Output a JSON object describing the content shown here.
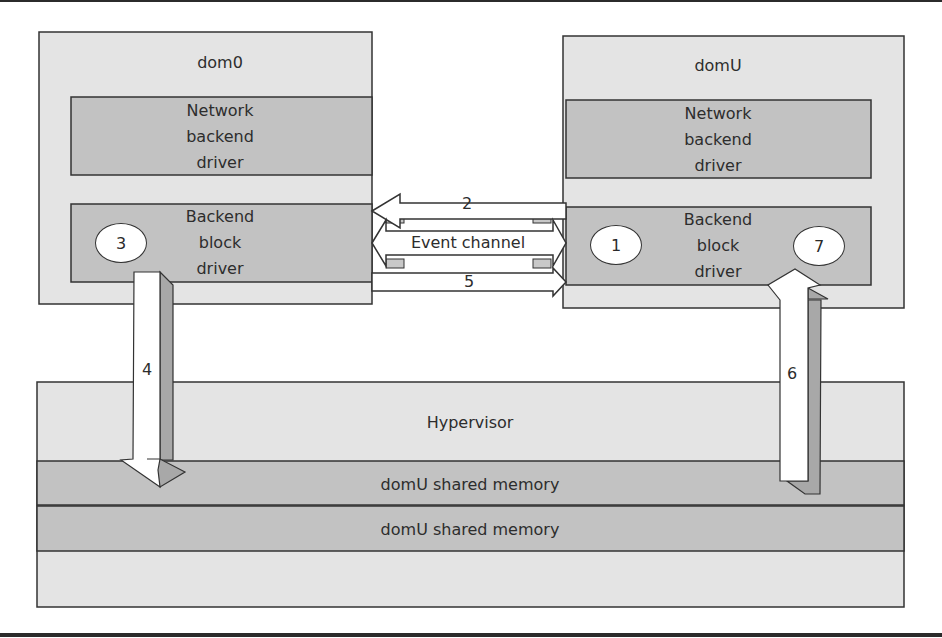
{
  "diagram": {
    "colors": {
      "light_fill": "#e4e4e4",
      "dark_fill": "#c2c2c2",
      "arrow_fill": "#ffffff",
      "arrow_shadow": "#a8a8a8",
      "stroke": "#333333"
    },
    "dom0": {
      "label": "dom0",
      "network_driver": {
        "line1": "Network",
        "line2": "backend",
        "line3": "driver"
      },
      "block_driver": {
        "line1": "Backend",
        "line2": "block",
        "line3": "driver"
      },
      "step_oval": "3"
    },
    "domU": {
      "label": "domU",
      "network_driver": {
        "line1": "Network",
        "line2": "backend",
        "line3": "driver"
      },
      "block_driver": {
        "line1": "Backend",
        "line2": "block",
        "line3": "driver"
      },
      "step_oval_left": "1",
      "step_oval_right": "7"
    },
    "channel": {
      "arrow_top_label": "2",
      "event_channel_label": "Event channel",
      "arrow_bottom_label": "5"
    },
    "vertical_arrows": {
      "down_label": "4",
      "up_label": "6"
    },
    "hypervisor": {
      "label": "Hypervisor",
      "shared_memory_1": "domU shared memory",
      "shared_memory_2": "domU shared memory"
    }
  }
}
